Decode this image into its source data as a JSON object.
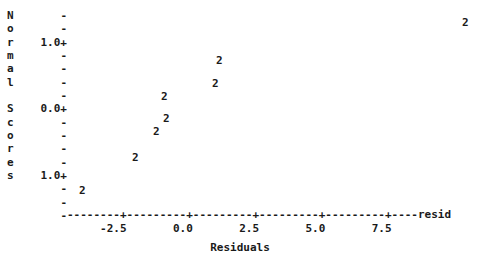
{
  "plot": {
    "type": "character-plot",
    "renderer": "minitab-normal-probability-plot",
    "background_color": "#ffffff",
    "text_color": "#1a1a1a"
  },
  "y_axis": {
    "caption_chars": [
      "N",
      "o",
      "r",
      "m",
      "a",
      "l",
      "",
      "S",
      "c",
      "o",
      "r",
      "e",
      "s",
      "",
      "",
      ""
    ],
    "caption_text": "Normal Scores",
    "tick_rows": [
      "-",
      "-",
      "1.0+",
      "-",
      "-",
      "-",
      "-",
      "0.0+",
      "-",
      "-",
      "-",
      "-",
      "1.0+",
      "-",
      "-",
      "-"
    ],
    "labeled_values": [
      "1.0",
      "0.0",
      "1.0"
    ],
    "labeled_rows": [
      2,
      7,
      12
    ],
    "tick_glyph_major": "+",
    "tick_glyph_minor": "-"
  },
  "x_axis": {
    "axis_line": "--------+---------+---------+---------+---------+----resid",
    "tick_label_line": "     -2.5       0.0       2.5       5.0       7.5",
    "tick_labels": [
      "-2.5",
      "0.0",
      "2.5",
      "5.0",
      "7.5"
    ],
    "title": "Residuals",
    "trailing_label": "resid"
  },
  "chart_data": {
    "type": "scatter",
    "title": "",
    "subtitle": "",
    "xlabel": "Residuals",
    "ylabel": "Normal Scores",
    "xlim": [
      -4.0,
      8.8
    ],
    "ylim": [
      -1.5,
      1.6
    ],
    "grid": false,
    "legend": null,
    "point_glyph": "2",
    "point_glyph_meaning": "two overlapping observations at this position",
    "marker_note": "each printed character '2' denotes 2 coincident observations",
    "series": [
      {
        "name": "normal-probability-points",
        "x": [
          7.6,
          0.7,
          0.6,
          -1.3,
          -1.2,
          -1.6,
          -2.2,
          -4.0
        ],
        "y": [
          1.35,
          0.85,
          0.55,
          0.25,
          -0.3,
          -0.55,
          -1.05,
          -1.85
        ],
        "pixel_points": [
          {
            "label": "2",
            "x": 462,
            "y": 22
          },
          {
            "label": "2",
            "x": 216,
            "y": 60
          },
          {
            "label": "2",
            "x": 212,
            "y": 83
          },
          {
            "label": "2",
            "x": 161,
            "y": 96
          },
          {
            "label": "2",
            "x": 163,
            "y": 118
          },
          {
            "label": "2",
            "x": 153,
            "y": 131
          },
          {
            "label": "2",
            "x": 132,
            "y": 157
          },
          {
            "label": "2",
            "x": 79,
            "y": 190
          }
        ]
      }
    ],
    "x_ticks": [
      -2.5,
      0.0,
      2.5,
      5.0,
      7.5
    ],
    "y_ticks": [
      1.0,
      0.0,
      -1.0
    ]
  }
}
